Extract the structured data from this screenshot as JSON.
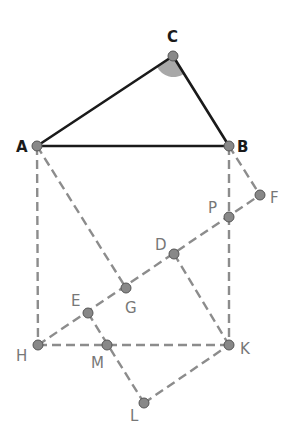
{
  "diagram": {
    "type": "geometry",
    "angle_marker": {
      "vertex": "C",
      "color": "#a8a8a8"
    },
    "points": {
      "C": {
        "label": "C",
        "x": 173,
        "y": 56
      },
      "A": {
        "label": "A",
        "x": 37,
        "y": 146
      },
      "B": {
        "label": "B",
        "x": 229,
        "y": 146
      },
      "F": {
        "label": "F",
        "x": 260,
        "y": 195
      },
      "P": {
        "label": "P",
        "x": 229,
        "y": 217
      },
      "D": {
        "label": "D",
        "x": 174,
        "y": 254
      },
      "G": {
        "label": "G",
        "x": 126,
        "y": 288
      },
      "E": {
        "label": "E",
        "x": 88,
        "y": 313
      },
      "H": {
        "label": "H",
        "x": 38,
        "y": 345
      },
      "M": {
        "label": "M",
        "x": 107,
        "y": 345
      },
      "K": {
        "label": "K",
        "x": 229,
        "y": 345
      },
      "L": {
        "label": "L",
        "x": 144,
        "y": 403
      }
    },
    "solid_segments": [
      [
        "A",
        "B"
      ],
      [
        "A",
        "C"
      ],
      [
        "C",
        "B"
      ]
    ],
    "dashed_segments": [
      [
        "A",
        "H"
      ],
      [
        "B",
        "K"
      ],
      [
        "H",
        "K"
      ],
      [
        "A",
        "G"
      ],
      [
        "B",
        "F"
      ],
      [
        "H",
        "F"
      ],
      [
        "D",
        "K"
      ],
      [
        "E",
        "L"
      ],
      [
        "L",
        "K"
      ]
    ],
    "colors": {
      "solid": "#1a1a1a",
      "dashed": "#8c8c8c",
      "point": "#888888"
    }
  }
}
